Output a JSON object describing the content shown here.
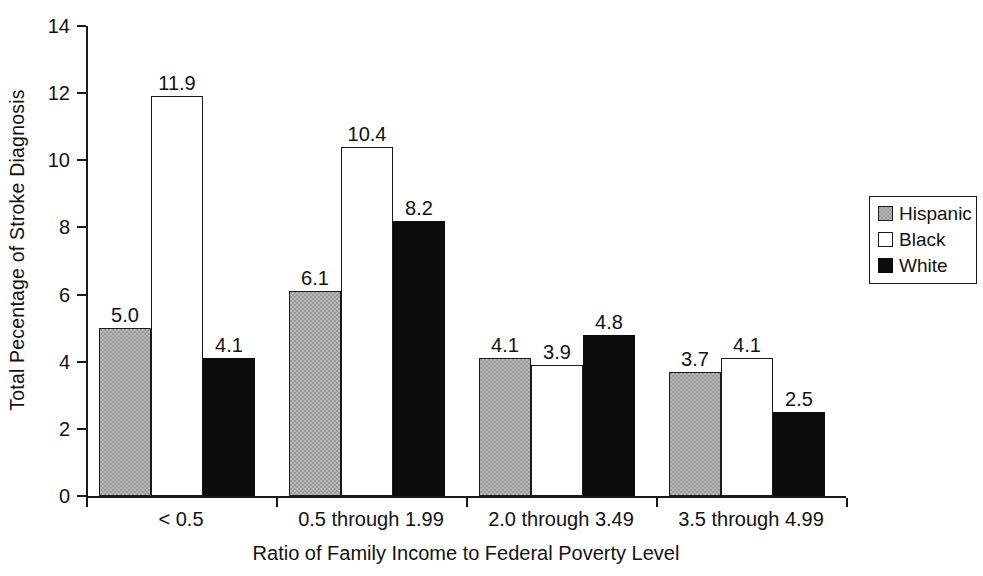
{
  "chart_data": {
    "type": "bar",
    "title": "",
    "xlabel": "Ratio of Family Income to Federal Poverty Level",
    "ylabel": "Total Pecentage of Stroke Diagnosis",
    "categories": [
      "< 0.5",
      "0.5 through 1.99",
      "2.0 through 3.49",
      "3.5 through 4.99"
    ],
    "series": [
      {
        "name": "Hispanic",
        "values": [
          5.0,
          6.1,
          4.1,
          3.7
        ],
        "color": "#9a9a9a"
      },
      {
        "name": "Black",
        "values": [
          11.9,
          10.4,
          3.9,
          4.1
        ],
        "color": "#ffffff"
      },
      {
        "name": "White",
        "values": [
          4.1,
          8.2,
          4.8,
          2.5
        ],
        "color": "#0c0c0c"
      }
    ],
    "value_labels": [
      [
        "5.0",
        "11.9",
        "4.1"
      ],
      [
        "6.1",
        "10.4",
        "8.2"
      ],
      [
        "4.1",
        "3.9",
        "4.8"
      ],
      [
        "3.7",
        "4.1",
        "2.5"
      ]
    ],
    "ylim": [
      0,
      14
    ],
    "yticks": [
      0,
      2,
      4,
      6,
      8,
      10,
      12,
      14
    ],
    "ytick_labels": [
      "0",
      "2",
      "4",
      "6",
      "8",
      "10",
      "12",
      "14"
    ],
    "grid": false,
    "legend_position": "right",
    "legend": {
      "entries": [
        {
          "label": "Hispanic",
          "swatch": "gray-hatched-swatch"
        },
        {
          "label": "Black",
          "swatch": "white-swatch"
        },
        {
          "label": "White",
          "swatch": "black-swatch"
        }
      ]
    }
  }
}
